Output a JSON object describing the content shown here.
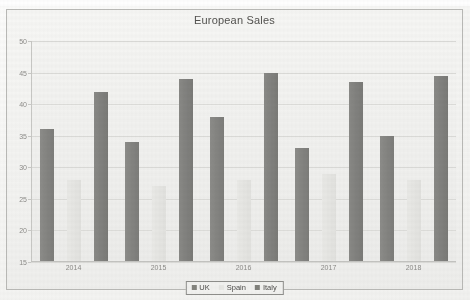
{
  "chart_data": {
    "type": "bar",
    "title": "European Sales",
    "xlabel": "",
    "ylabel": "",
    "categories": [
      "2014",
      "2015",
      "2016",
      "2017",
      "2018"
    ],
    "series": [
      {
        "name": "UK",
        "color": "#85857f",
        "values": [
          36,
          34,
          38,
          33,
          35
        ]
      },
      {
        "name": "Spain",
        "color": "#e8e8e5",
        "values": [
          28,
          27,
          28,
          29,
          28
        ]
      },
      {
        "name": "Italy",
        "color": "#82827c",
        "values": [
          42,
          44,
          45,
          43.5,
          44.5
        ]
      }
    ],
    "ylim": [
      15,
      50
    ],
    "yticks": [
      50,
      45,
      40,
      35,
      30,
      25,
      20,
      15
    ],
    "ytick_labels": [
      "50",
      "45",
      "40",
      "35",
      "30",
      "25",
      "20",
      "15"
    ],
    "grid": true,
    "legend_position": "bottom"
  },
  "legend": {
    "items": [
      {
        "label": "UK"
      },
      {
        "label": "Spain"
      },
      {
        "label": "Italy"
      }
    ]
  }
}
